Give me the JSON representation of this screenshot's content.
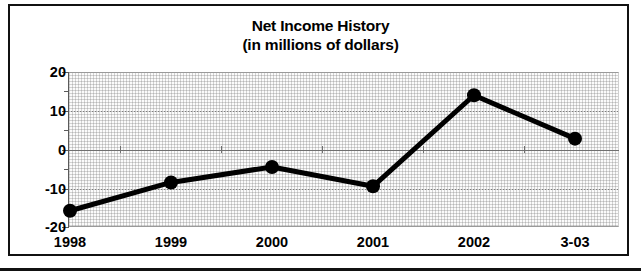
{
  "chart_data": {
    "type": "line",
    "title": "Net Income History",
    "subtitle": "(in millions of dollars)",
    "xlabel": "",
    "ylabel": "",
    "categories": [
      "1998",
      "1999",
      "2000",
      "2001",
      "2002",
      "3-03"
    ],
    "values": [
      -15.8,
      -8.5,
      -4.5,
      -9.5,
      14.0,
      2.8
    ],
    "series": [
      {
        "name": "Net Income",
        "values": [
          -15.8,
          -8.5,
          -4.5,
          -9.5,
          14.0,
          2.8
        ]
      }
    ],
    "ylim": [
      -20,
      20
    ],
    "ytick_labels": [
      "20",
      "10",
      "0",
      "-10",
      "-20"
    ],
    "ytick_values": [
      20,
      10,
      0,
      -10,
      -20
    ],
    "yminor_values": [
      15,
      5,
      -5,
      -15
    ],
    "grid": true,
    "gridline_style": "dotted",
    "zero_line": true,
    "legend": null,
    "legend_position": "none",
    "marker": "circle",
    "marker_color": "#000000",
    "line_color": "#000000",
    "plot_background": "#fbfbfb",
    "frame_color": "#111111"
  }
}
